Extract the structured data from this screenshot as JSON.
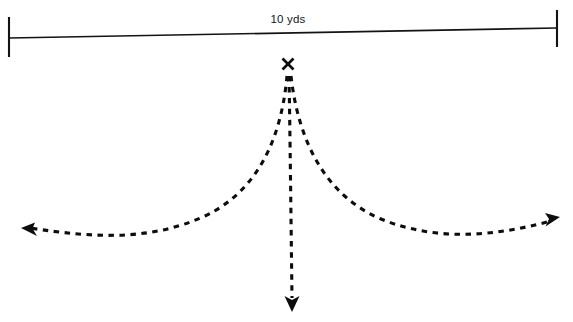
{
  "diagram": {
    "background_color": "#ffffff",
    "stroke_color": "#0d0d0d",
    "width": 573,
    "height": 322
  },
  "dimension": {
    "label": "10 yds",
    "label_x": 288,
    "label_y": 23,
    "line": {
      "x1": 9,
      "y1": 38,
      "x2": 557,
      "y2": 28
    },
    "tick_left": {
      "x": 9,
      "y1": 17,
      "y2": 57
    },
    "tick_right": {
      "x": 557,
      "y1": 10,
      "y2": 47
    }
  },
  "start_marker": {
    "icon": "x-mark",
    "label": "X",
    "center_x": 288,
    "center_y": 64,
    "size": 11
  },
  "routes": [
    {
      "name": "left-curl-route",
      "direction": "left",
      "path": "M 287 76 C 283 120 268 186 205 216 C 150 241 95 238 30 228",
      "arrow_tip": {
        "x": 22,
        "y": 229
      },
      "arrow_angle": -173,
      "end_label": "left-arrowhead"
    },
    {
      "name": "straight-go-route",
      "direction": "down",
      "path": "M 289 76 C 290 130 291 220 292 298",
      "arrow_tip": {
        "x": 292,
        "y": 311
      },
      "arrow_angle": 90,
      "end_label": "down-arrowhead"
    },
    {
      "name": "right-curl-route",
      "direction": "right",
      "path": "M 291 76 C 296 120 313 190 381 219 C 437 242 495 236 551 221",
      "arrow_tip": {
        "x": 559,
        "y": 218
      },
      "arrow_angle": -15,
      "end_label": "right-arrowhead"
    }
  ]
}
